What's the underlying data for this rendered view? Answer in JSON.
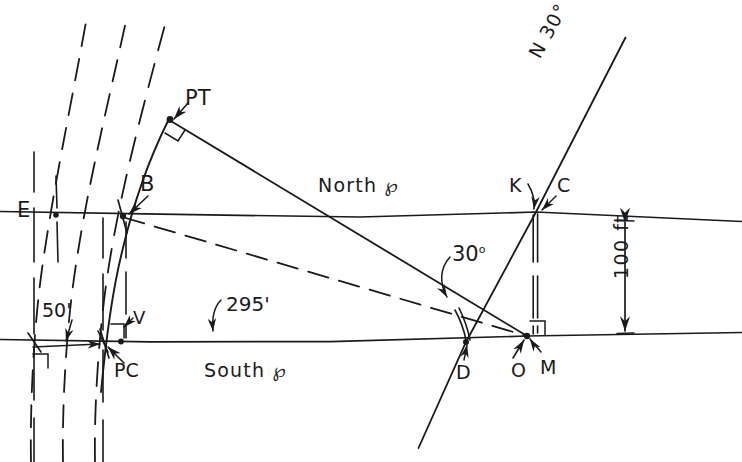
{
  "figure": {
    "kind": "surveying-plan-diagram",
    "width": 742,
    "height": 462,
    "ink_color": "#1a1a1a",
    "background_color": "#ffffff"
  },
  "labels": {
    "pt": "PT",
    "b": "B",
    "e": "E",
    "north_centerline": "North ℘",
    "k": "K",
    "c": "C",
    "bearing": "N 30° E",
    "offset_distance": "100 ft",
    "angle": "30",
    "angle_degree_symbol": "o",
    "dim_50": "50'",
    "dim_295": "295'",
    "v": "V",
    "pc": "PC",
    "south_centerline": "South ℘",
    "d": "D",
    "o": "O",
    "m": "M"
  },
  "geometry": {
    "north_centerline": {
      "from": [
        0,
        212
      ],
      "to": [
        742,
        222
      ]
    },
    "south_centerline": {
      "from": [
        0,
        339
      ],
      "to": [
        742,
        333
      ]
    },
    "points": {
      "E": [
        55,
        215
      ],
      "B": [
        123,
        216
      ],
      "PT": [
        170,
        119
      ],
      "K": [
        536,
        212
      ],
      "C": [
        536,
        212
      ],
      "PC": [
        105,
        343
      ],
      "V": [
        121,
        342
      ],
      "D": [
        466,
        342
      ],
      "O": [
        527,
        336
      ],
      "M": [
        527,
        336
      ]
    },
    "solid_lines": [
      {
        "name": "PT-to-O tangent",
        "from": [
          170,
          119
        ],
        "to": [
          527,
          336
        ]
      },
      {
        "name": "N30E-bearing-line",
        "from": [
          625,
          38
        ],
        "to": [
          418,
          448
        ]
      }
    ],
    "dashed_lines": [
      {
        "name": "B-to-O-chord",
        "from": [
          123,
          217
        ],
        "to": [
          527,
          336
        ]
      }
    ],
    "arcs": [
      {
        "name": "curve-PC-B-PT",
        "style": "solid",
        "through": [
          "PC",
          "B",
          "PT"
        ]
      },
      {
        "name": "offset-arc-1",
        "style": "dashed"
      },
      {
        "name": "offset-arc-2",
        "style": "dashed"
      },
      {
        "name": "offset-arc-3",
        "style": "dashed"
      }
    ],
    "dimension_lines": [
      {
        "name": "100-ft-vertical",
        "from": [
          625,
          220
        ],
        "to": [
          625,
          334
        ],
        "arrows": "both"
      },
      {
        "name": "50-ft-horizontal",
        "from": [
          33,
          347
        ],
        "to": [
          105,
          344
        ],
        "arrows": "both"
      }
    ]
  }
}
